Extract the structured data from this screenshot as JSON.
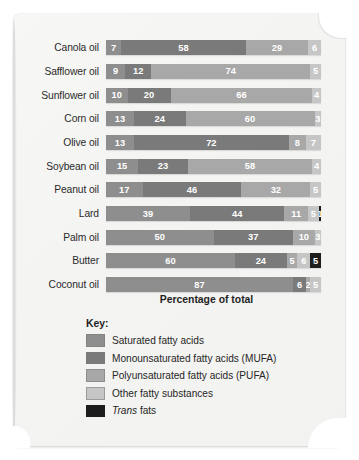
{
  "chart_data": {
    "type": "bar",
    "subtype": "stacked-horizontal-100",
    "title": "",
    "xlabel": "Percentage of total",
    "ylabel": "",
    "xlim": [
      0,
      100
    ],
    "grid": false,
    "legend_position": "bottom-left",
    "categories": [
      "Canola oil",
      "Safflower oil",
      "Sunflower oil",
      "Corn oil",
      "Olive oil",
      "Soybean oil",
      "Peanut oil",
      "Lard",
      "Palm oil",
      "Butter",
      "Coconut oil"
    ],
    "series": [
      {
        "name": "Saturated fatty acids",
        "key": "sat",
        "color": "#8e8e8e",
        "values": [
          7,
          9,
          10,
          13,
          13,
          15,
          17,
          39,
          50,
          60,
          87
        ]
      },
      {
        "name": "Monounsaturated fatty acids (MUFA)",
        "key": "mufa",
        "color": "#7a7a7a",
        "values": [
          58,
          12,
          20,
          24,
          72,
          23,
          46,
          44,
          37,
          24,
          6
        ]
      },
      {
        "name": "Polyunsaturated fatty acids (PUFA)",
        "key": "pufa",
        "color": "#a8a8a8",
        "values": [
          29,
          74,
          66,
          60,
          8,
          58,
          32,
          11,
          10,
          5,
          2
        ]
      },
      {
        "name": "Other fatty substances",
        "key": "other",
        "color": "#c6c6c6",
        "values": [
          6,
          5,
          4,
          3,
          7,
          4,
          5,
          5,
          3,
          6,
          5
        ]
      },
      {
        "name": "Trans fats",
        "key": "trans",
        "color": "#1d1d1d",
        "values": [
          0,
          0,
          0,
          0,
          0,
          0,
          0,
          1,
          0,
          5,
          0
        ]
      }
    ],
    "rows": [
      {
        "label": "Canola oil",
        "segments": [
          {
            "key": "sat",
            "value": 7,
            "label": "7"
          },
          {
            "key": "mufa",
            "value": 58,
            "label": "58"
          },
          {
            "key": "pufa",
            "value": 29,
            "label": "29"
          },
          {
            "key": "other",
            "value": 6,
            "label": "6"
          }
        ]
      },
      {
        "label": "Safflower oil",
        "segments": [
          {
            "key": "sat",
            "value": 9,
            "label": "9"
          },
          {
            "key": "mufa",
            "value": 12,
            "label": "12"
          },
          {
            "key": "pufa",
            "value": 74,
            "label": "74"
          },
          {
            "key": "other",
            "value": 5,
            "label": "5"
          }
        ]
      },
      {
        "label": "Sunflower oil",
        "segments": [
          {
            "key": "sat",
            "value": 10,
            "label": "10"
          },
          {
            "key": "mufa",
            "value": 20,
            "label": "20"
          },
          {
            "key": "pufa",
            "value": 66,
            "label": "66"
          },
          {
            "key": "other",
            "value": 4,
            "label": "4"
          }
        ]
      },
      {
        "label": "Corn oil",
        "segments": [
          {
            "key": "sat",
            "value": 13,
            "label": "13"
          },
          {
            "key": "mufa",
            "value": 24,
            "label": "24"
          },
          {
            "key": "pufa",
            "value": 60,
            "label": "60"
          },
          {
            "key": "other",
            "value": 3,
            "label": "3"
          }
        ]
      },
      {
        "label": "Olive oil",
        "segments": [
          {
            "key": "sat",
            "value": 13,
            "label": "13"
          },
          {
            "key": "mufa",
            "value": 72,
            "label": "72"
          },
          {
            "key": "pufa",
            "value": 8,
            "label": "8"
          },
          {
            "key": "other",
            "value": 7,
            "label": "7"
          }
        ]
      },
      {
        "label": "Soybean oil",
        "segments": [
          {
            "key": "sat",
            "value": 15,
            "label": "15"
          },
          {
            "key": "mufa",
            "value": 23,
            "label": "23"
          },
          {
            "key": "pufa",
            "value": 58,
            "label": "58"
          },
          {
            "key": "other",
            "value": 4,
            "label": "4"
          }
        ]
      },
      {
        "label": "Peanut oil",
        "segments": [
          {
            "key": "sat",
            "value": 17,
            "label": "17"
          },
          {
            "key": "mufa",
            "value": 46,
            "label": "46"
          },
          {
            "key": "pufa",
            "value": 32,
            "label": "32"
          },
          {
            "key": "other",
            "value": 5,
            "label": "5"
          }
        ]
      },
      {
        "label": "Lard",
        "segments": [
          {
            "key": "sat",
            "value": 39,
            "label": "39"
          },
          {
            "key": "mufa",
            "value": 44,
            "label": "44"
          },
          {
            "key": "pufa",
            "value": 11,
            "label": "11"
          },
          {
            "key": "other",
            "value": 5,
            "label": "5"
          },
          {
            "key": "trans",
            "value": 1,
            "label": "1"
          }
        ]
      },
      {
        "label": "Palm oil",
        "segments": [
          {
            "key": "sat",
            "value": 50,
            "label": "50"
          },
          {
            "key": "mufa",
            "value": 37,
            "label": "37"
          },
          {
            "key": "pufa",
            "value": 10,
            "label": "10"
          },
          {
            "key": "other",
            "value": 3,
            "label": "3"
          }
        ]
      },
      {
        "label": "Butter",
        "segments": [
          {
            "key": "sat",
            "value": 60,
            "label": "60"
          },
          {
            "key": "mufa",
            "value": 24,
            "label": "24"
          },
          {
            "key": "pufa",
            "value": 5,
            "label": "5"
          },
          {
            "key": "other",
            "value": 6,
            "label": "6"
          },
          {
            "key": "trans",
            "value": 5,
            "label": "5"
          }
        ]
      },
      {
        "label": "Coconut oil",
        "segments": [
          {
            "key": "sat",
            "value": 87,
            "label": "87"
          },
          {
            "key": "mufa",
            "value": 6,
            "label": "6"
          },
          {
            "key": "pufa",
            "value": 2,
            "label": "2"
          },
          {
            "key": "other",
            "value": 5,
            "label": "5"
          }
        ]
      }
    ],
    "legend": {
      "title": "Key:",
      "items": [
        {
          "key": "sat",
          "label": "Saturated fatty acids",
          "color": "#8e8e8e",
          "italic_prefix": ""
        },
        {
          "key": "mufa",
          "label": "Monounsaturated fatty acids (MUFA)",
          "color": "#7a7a7a",
          "italic_prefix": ""
        },
        {
          "key": "pufa",
          "label": "Polyunsaturated fatty acids (PUFA)",
          "color": "#a8a8a8",
          "italic_prefix": ""
        },
        {
          "key": "other",
          "label": "Other fatty substances",
          "color": "#c6c6c6",
          "italic_prefix": ""
        },
        {
          "key": "trans",
          "label": "fats",
          "color": "#1d1d1d",
          "italic_prefix": "Trans"
        }
      ]
    }
  }
}
